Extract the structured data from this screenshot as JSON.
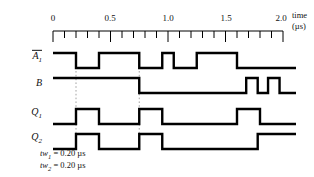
{
  "figure": {
    "kind": "digital-timing-diagram",
    "width": 314,
    "height": 177,
    "line_color": "#000000",
    "guide_color": "#9a9a9a"
  },
  "axis": {
    "title_line1": "time",
    "title_line2": "(µs)",
    "unit": "µs",
    "min": 0,
    "max": 2.0,
    "major_step": 0.5,
    "minor_step": 0.1,
    "x_left_px": 53,
    "x_right_px": 283,
    "px_per_us": 115,
    "labels": [
      "0",
      "0.5",
      "1.0",
      "1.5",
      "2.0"
    ],
    "label_values": [
      0,
      0.5,
      1.0,
      1.5,
      2.0
    ],
    "minor_tick_values": [
      0.1,
      0.2,
      0.3,
      0.4,
      0.6,
      0.7,
      0.8,
      0.9,
      1.1,
      1.2,
      1.3,
      1.4,
      1.6,
      1.7,
      1.8,
      1.9
    ]
  },
  "guides": {
    "values": [
      0.2,
      0.75
    ]
  },
  "chart_data": {
    "type": "line",
    "title": "",
    "xlabel": "time (µs)",
    "ylabel": "",
    "xlim": [
      0,
      2.0
    ],
    "grid": false,
    "legend": "none",
    "signals": [
      {
        "name": "A1-bar",
        "label_html": "A̅1",
        "initial_level": 1,
        "transitions": [
          0.2,
          0.4,
          0.75,
          0.95,
          1.05,
          1.25,
          1.6
        ],
        "description": "active-low trigger: high with narrow low pulses, then low at end"
      },
      {
        "name": "B",
        "label_html": "B",
        "initial_level": 1,
        "transitions": [
          0.75,
          1.68,
          1.78,
          1.87,
          1.97
        ],
        "description": "high, then low, then two narrow high pulses near end"
      },
      {
        "name": "Q1",
        "label_html": "Q1",
        "initial_level": 0,
        "transitions": [
          0.2,
          0.4,
          0.75,
          0.95,
          1.6,
          1.8
        ],
        "description": "one-shot output: three 0.20 us high pulses"
      },
      {
        "name": "Q2",
        "label_html": "Q2",
        "initial_level": 0,
        "transitions": [
          0.2,
          0.4,
          0.75,
          0.95,
          1.78
        ],
        "description": "one-shot output: two 0.20 us high pulses then stays high"
      }
    ]
  },
  "signal_labels": [
    {
      "base": "A",
      "sub": "1",
      "overbar": true
    },
    {
      "base": "B",
      "sub": "",
      "overbar": false
    },
    {
      "base": "Q",
      "sub": "1",
      "overbar": false
    },
    {
      "base": "Q",
      "sub": "2",
      "overbar": false
    }
  ],
  "notes": [
    {
      "symbol": "tw",
      "sub": "1",
      "eq": "=",
      "value": "0.20",
      "unit": "µs"
    },
    {
      "symbol": "tw",
      "sub": "2",
      "eq": "=",
      "value": "0.20",
      "unit": "µs"
    }
  ]
}
